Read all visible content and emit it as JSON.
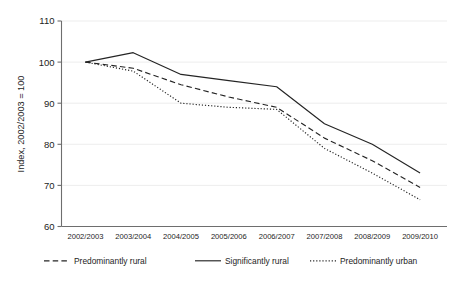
{
  "chart_data": {
    "type": "line",
    "title": "",
    "xlabel": "",
    "ylabel": "Index, 2002/2003 = 100",
    "categories": [
      "2002/2003",
      "2003/2004",
      "2004/2005",
      "2005/2006",
      "2006/2007",
      "2007/2008",
      "2008/2009",
      "2009/2010"
    ],
    "ylim": [
      60,
      110
    ],
    "yticks": [
      60,
      70,
      80,
      90,
      100,
      110
    ],
    "ytick_labels": [
      "60",
      "70",
      "80",
      "90",
      "100",
      "110"
    ],
    "grid": true,
    "legend_position": "bottom",
    "series": [
      {
        "name": "Predominantly rural",
        "style": "dashed",
        "color": "#242424",
        "values": [
          100,
          98.5,
          94.5,
          91.5,
          89,
          81.5,
          76,
          69.5
        ]
      },
      {
        "name": "Significantly rural",
        "style": "solid",
        "color": "#242424",
        "values": [
          100,
          102.3,
          97,
          95.5,
          94,
          85,
          80,
          73
        ]
      },
      {
        "name": "Predominantly urban",
        "style": "dotted",
        "color": "#242424",
        "values": [
          100,
          97.8,
          90,
          89,
          88.5,
          79,
          73,
          66.5
        ]
      }
    ]
  },
  "legend": {
    "items": [
      {
        "label": "Predominantly rural",
        "style": "dashed"
      },
      {
        "label": "Significantly rural",
        "style": "solid"
      },
      {
        "label": "Predominantly urban",
        "style": "dotted"
      }
    ]
  },
  "colors": {
    "ink": "#242424",
    "axis": "#6e6e6e",
    "grid": "#e9e9e9",
    "background": "#ffffff"
  }
}
